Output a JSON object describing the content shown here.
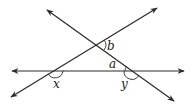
{
  "diagram": {
    "type": "geometry-angles",
    "stroke_color": "#2a2a2a",
    "lines": [
      {
        "name": "horizontal-line",
        "from": [
          12,
          71
        ],
        "to": [
          184,
          71
        ],
        "arrows": "both"
      },
      {
        "name": "ascending-line",
        "from": [
          11,
          97
        ],
        "to": [
          157,
          8
        ],
        "arrows": "both"
      },
      {
        "name": "descending-line",
        "from": [
          47,
          10
        ],
        "to": [
          174,
          101
        ],
        "arrows": "both"
      }
    ],
    "intersections": {
      "top": [
        97,
        45
      ],
      "left": [
        55,
        71
      ],
      "right": [
        132,
        71
      ]
    },
    "labels": {
      "a": "a",
      "b": "b",
      "x": "x",
      "y": "y"
    }
  }
}
